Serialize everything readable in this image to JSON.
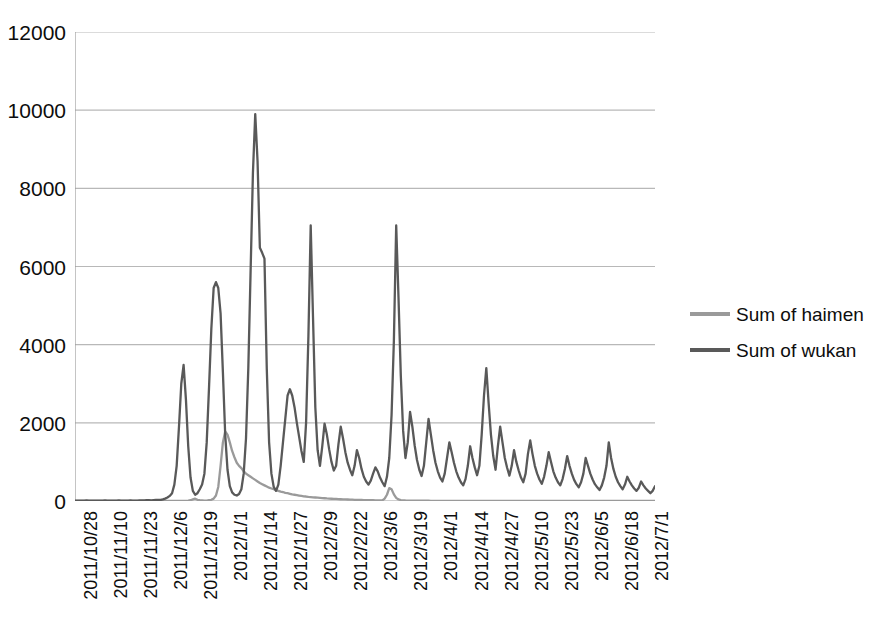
{
  "chart_data": {
    "type": "line",
    "title": "",
    "subtitle": "",
    "xlabel": "",
    "ylabel": "",
    "ylim": [
      0,
      12000
    ],
    "y_ticks": [
      0,
      2000,
      4000,
      6000,
      8000,
      10000,
      12000
    ],
    "y_tick_labels": [
      "0",
      "2000",
      "4000",
      "6000",
      "8000",
      "10000",
      "12000"
    ],
    "grid": "horizontal",
    "legend_position": "right",
    "x_axis_type": "date",
    "x_tick_interval_days": 13,
    "x_tick_labels": [
      "2011/10/28",
      "2011/11/10",
      "2011/11/23",
      "2011/12/6",
      "2011/12/19",
      "2012/1/1",
      "2012/1/14",
      "2012/1/27",
      "2012/2/9",
      "2012/2/22",
      "2012/3/6",
      "2012/3/19",
      "2012/4/1",
      "2012/4/14",
      "2012/4/27",
      "2012/5/10",
      "2012/5/23",
      "2012/6/5",
      "2012/6/18",
      "2012/7/1"
    ],
    "x_start": "2011/10/28",
    "x_end": "2012/7/5",
    "n_points": 252,
    "series": [
      {
        "name": "Sum of haimen",
        "color": "#9a9a9a",
        "values": [
          0,
          0,
          0,
          0,
          0,
          0,
          0,
          0,
          0,
          0,
          0,
          0,
          0,
          0,
          0,
          0,
          0,
          0,
          0,
          0,
          0,
          0,
          0,
          0,
          0,
          0,
          0,
          0,
          0,
          0,
          0,
          0,
          0,
          0,
          0,
          0,
          0,
          0,
          0,
          0,
          0,
          0,
          0,
          0,
          0,
          0,
          0,
          0,
          5,
          10,
          20,
          40,
          60,
          30,
          20,
          15,
          10,
          10,
          20,
          30,
          60,
          140,
          360,
          900,
          1500,
          1780,
          1700,
          1500,
          1280,
          1120,
          980,
          900,
          840,
          760,
          700,
          660,
          620,
          580,
          540,
          500,
          460,
          430,
          400,
          370,
          340,
          320,
          300,
          280,
          260,
          240,
          230,
          210,
          200,
          185,
          170,
          160,
          150,
          140,
          130,
          120,
          115,
          105,
          100,
          95,
          90,
          85,
          80,
          75,
          70,
          65,
          62,
          58,
          55,
          52,
          48,
          45,
          42,
          40,
          38,
          35,
          33,
          31,
          29,
          27,
          25,
          24,
          22,
          21,
          20,
          19,
          18,
          17,
          16,
          15,
          60,
          160,
          330,
          300,
          170,
          80,
          40,
          25,
          18,
          14,
          12,
          10,
          9,
          8,
          8,
          7,
          7,
          6,
          6,
          6,
          5,
          5,
          5,
          5,
          4,
          4,
          4,
          4,
          4,
          3,
          3,
          3,
          3,
          3,
          3,
          3,
          2,
          2,
          2,
          2,
          2,
          2,
          2,
          2,
          2,
          2,
          2,
          2,
          2,
          2,
          2,
          2,
          2,
          2,
          2,
          2,
          2,
          2,
          2,
          2,
          1,
          1,
          1,
          1,
          1,
          1,
          1,
          1,
          1,
          1,
          1,
          1,
          1,
          1,
          1,
          1,
          1,
          1,
          1,
          1,
          1,
          1,
          1,
          1,
          1,
          1,
          1,
          1,
          1,
          1,
          1,
          1,
          1,
          1,
          1,
          1,
          1,
          1,
          1,
          1,
          1,
          1,
          1,
          1,
          1,
          1,
          1,
          1,
          1,
          1,
          1,
          1,
          1,
          1,
          1,
          1,
          1,
          1,
          1,
          1,
          1,
          1,
          1,
          1,
          1,
          1,
          1,
          1,
          1,
          1,
          1,
          1,
          1,
          1,
          1,
          1,
          1,
          1
        ]
      },
      {
        "name": "Sum of wukan",
        "color": "#595959",
        "values": [
          10,
          8,
          12,
          10,
          9,
          14,
          12,
          10,
          9,
          12,
          10,
          9,
          11,
          13,
          10,
          9,
          12,
          11,
          10,
          14,
          12,
          10,
          9,
          11,
          13,
          12,
          10,
          9,
          14,
          16,
          18,
          22,
          20,
          18,
          24,
          30,
          28,
          26,
          40,
          60,
          90,
          130,
          200,
          420,
          900,
          1900,
          3000,
          3480,
          2600,
          1400,
          600,
          260,
          160,
          200,
          300,
          420,
          700,
          1500,
          2900,
          4400,
          5450,
          5600,
          5450,
          4800,
          3300,
          1700,
          800,
          380,
          220,
          160,
          140,
          180,
          300,
          700,
          1600,
          3400,
          5900,
          8400,
          9900,
          8700,
          6480,
          6350,
          6200,
          3380,
          1500,
          700,
          360,
          260,
          420,
          900,
          1500,
          2100,
          2700,
          2860,
          2700,
          2400,
          2000,
          1640,
          1280,
          1000,
          2000,
          4200,
          7050,
          4700,
          2400,
          1300,
          900,
          1400,
          1980,
          1700,
          1320,
          1000,
          780,
          900,
          1450,
          1900,
          1600,
          1250,
          980,
          800,
          660,
          900,
          1300,
          1100,
          820,
          620,
          500,
          420,
          520,
          700,
          860,
          760,
          600,
          480,
          380,
          620,
          1100,
          2200,
          4100,
          7050,
          5200,
          3200,
          1800,
          1100,
          1500,
          2280,
          1900,
          1420,
          1050,
          800,
          640,
          900,
          1500,
          2100,
          1700,
          1300,
          980,
          760,
          600,
          500,
          700,
          1100,
          1500,
          1250,
          980,
          760,
          600,
          480,
          400,
          560,
          900,
          1400,
          1100,
          860,
          660,
          900,
          1700,
          2700,
          3400,
          2500,
          1700,
          1150,
          800,
          1400,
          1900,
          1500,
          1100,
          850,
          650,
          900,
          1300,
          1000,
          780,
          600,
          480,
          700,
          1200,
          1550,
          1200,
          900,
          700,
          550,
          440,
          620,
          900,
          1250,
          1000,
          760,
          600,
          480,
          400,
          560,
          820,
          1150,
          900,
          700,
          540,
          430,
          350,
          480,
          700,
          1100,
          900,
          700,
          550,
          430,
          350,
          280,
          400,
          600,
          900,
          1500,
          1100,
          820,
          620,
          480,
          380,
          300,
          420,
          620,
          500,
          400,
          320,
          260,
          340,
          500,
          400,
          320,
          260,
          200,
          260,
          380
        ]
      }
    ]
  },
  "legend": {
    "entries": [
      {
        "label": "Sum of haimen",
        "color": "#9a9a9a",
        "swatch_name": "legend-swatch-haimen"
      },
      {
        "label": "Sum of wukan",
        "color": "#595959",
        "swatch_name": "legend-swatch-wukan"
      }
    ]
  },
  "colors": {
    "haimen": "#9a9a9a",
    "wukan": "#595959",
    "gridline": "#b8b8b8",
    "axis": "#9d9d9d",
    "text": "#0d0d0d",
    "background": "#ffffff"
  }
}
